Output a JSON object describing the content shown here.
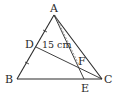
{
  "figure": {
    "type": "geometry-triangle",
    "points": {
      "A": {
        "label": "A",
        "x": 54,
        "y": 15
      },
      "B": {
        "label": "B",
        "x": 17,
        "y": 79
      },
      "C": {
        "label": "C",
        "x": 102,
        "y": 79
      },
      "D": {
        "label": "D",
        "x": 36,
        "y": 47
      },
      "E": {
        "label": "E",
        "x": 84,
        "y": 79
      },
      "F": {
        "label": "F",
        "x": 80,
        "y": 66
      }
    },
    "segments": [
      "AB",
      "BC",
      "CA",
      "AE",
      "DC"
    ],
    "dashed_segments": [
      "AF"
    ],
    "equal_marks": [
      "AD",
      "DB"
    ],
    "measurement": {
      "label": "15 cm",
      "segment": "DF"
    },
    "colors": {
      "stroke": "#2a2a2a",
      "dashed": "#777777",
      "background": "#ffffff"
    }
  }
}
